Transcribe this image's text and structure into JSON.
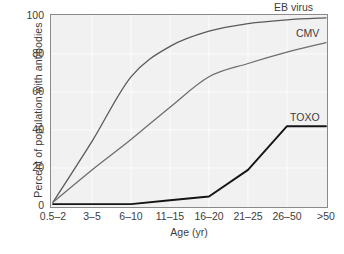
{
  "chart_data": {
    "type": "line",
    "title": "",
    "xlabel": "Age (yr)",
    "ylabel": "Percent of population with antibodies",
    "categories": [
      "0.5–2",
      "3–5",
      "6–10",
      "11–15",
      "16–20",
      "21–25",
      "26–50",
      ">50"
    ],
    "ylim": [
      0,
      100
    ],
    "yticks": [
      "0",
      "20",
      "40",
      "60",
      "80",
      "100"
    ],
    "ytick_values": [
      0,
      20,
      40,
      60,
      80,
      100
    ],
    "grid": true,
    "legend_position": "inline-right-of-curves",
    "series": [
      {
        "name": "EB virus",
        "color": "#5a5a5a",
        "label": "EB virus",
        "values": [
          2,
          34,
          68,
          84,
          92,
          96,
          98,
          99
        ]
      },
      {
        "name": "CMV",
        "color": "#6e6e6e",
        "label": "CMV",
        "values": [
          2,
          19,
          35,
          52,
          68,
          75,
          81,
          86
        ]
      },
      {
        "name": "TOXO",
        "color": "#141414",
        "label": "TOXO",
        "values": [
          1,
          1,
          1,
          3,
          5,
          19,
          42,
          42
        ]
      }
    ]
  }
}
